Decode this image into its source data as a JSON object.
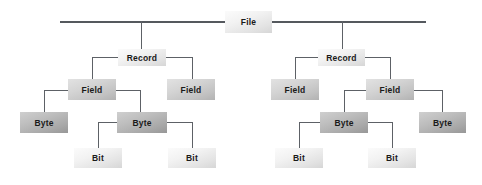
{
  "diagram": {
    "type": "tree",
    "levels": [
      "File",
      "Record",
      "Field",
      "Byte",
      "Bit"
    ],
    "colors": {
      "line": "#5d6166",
      "text": "#1a1a1a",
      "background": "#ffffff",
      "level_light": "#f2f2f2",
      "level_mid": "#c2c2c2",
      "level_dark": "#a8a8a8"
    },
    "nodes": {
      "file": "File",
      "record_left": "Record",
      "record_right": "Record",
      "field_l1": "Field",
      "field_l2": "Field",
      "field_r1": "Field",
      "field_r2": "Field",
      "byte_l1": "Byte",
      "byte_l2": "Byte",
      "byte_r1": "Byte",
      "byte_r2": "Byte",
      "bit_l1": "Bit",
      "bit_l2": "Bit",
      "bit_r1": "Bit",
      "bit_r2": "Bit"
    }
  }
}
